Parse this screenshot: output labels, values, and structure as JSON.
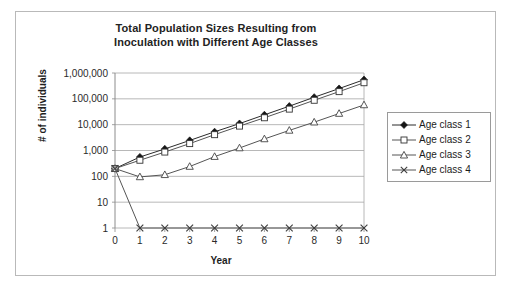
{
  "chart_data": {
    "type": "line",
    "title": "Total Population Sizes Resulting from Inoculation with Different Age Classes",
    "title_line1": "Total Population Sizes Resulting from",
    "title_line2": "Inoculation with Different Age Classes",
    "xlabel": "Year",
    "ylabel": "# of individuals",
    "yscale": "log",
    "ylim": [
      1,
      1000000
    ],
    "xlim": [
      0,
      10
    ],
    "grid": true,
    "legend_position": "right",
    "x": [
      0,
      1,
      2,
      3,
      4,
      5,
      6,
      7,
      8,
      9,
      10
    ],
    "xtick_labels": [
      "0",
      "1",
      "2",
      "3",
      "4",
      "5",
      "6",
      "7",
      "8",
      "9",
      "10"
    ],
    "ytick_values": [
      1,
      10,
      100,
      1000,
      10000,
      100000,
      1000000
    ],
    "ytick_labels": [
      "1",
      "10",
      "100",
      "1,000",
      "10,000",
      "100,000",
      "1,000,000"
    ],
    "series": [
      {
        "name": "Age class 1",
        "marker": "filled-diamond",
        "color": "#2b2b2b",
        "values": [
          200,
          560,
          1150,
          2450,
          5300,
          11000,
          24000,
          52000,
          115000,
          250000,
          550000
        ]
      },
      {
        "name": "Age class 2",
        "marker": "open-square",
        "color": "#555555",
        "values": [
          200,
          420,
          870,
          1850,
          4100,
          8800,
          18500,
          40000,
          88000,
          190000,
          420000
        ]
      },
      {
        "name": "Age class 3",
        "marker": "open-triangle",
        "color": "#555555",
        "values": [
          200,
          95,
          115,
          240,
          580,
          1250,
          2800,
          6000,
          12500,
          27000,
          58000
        ]
      },
      {
        "name": "Age class 4",
        "marker": "cross",
        "color": "#555555",
        "values": [
          200,
          1,
          1,
          1,
          1,
          1,
          1,
          1,
          1,
          1,
          1
        ]
      }
    ]
  },
  "legend": {
    "items": [
      {
        "label": "Age class 1"
      },
      {
        "label": "Age class 2"
      },
      {
        "label": "Age class 3"
      },
      {
        "label": "Age class 4"
      }
    ]
  }
}
